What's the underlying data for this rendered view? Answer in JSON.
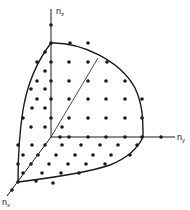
{
  "diagram": {
    "title": "",
    "axes": {
      "z_label": "n",
      "z_sub": "z",
      "y_label": "n",
      "y_sub": "y",
      "x_label": "n",
      "x_sub": "x"
    },
    "colors": {
      "ink": "#1a1a1a",
      "background": "#ffffff"
    }
  }
}
